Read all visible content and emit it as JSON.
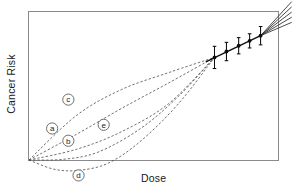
{
  "chart_data": {
    "type": "line",
    "title": "",
    "xlabel": "Dose",
    "ylabel": "Cancer Risk",
    "grid": false,
    "legend": "inline-callouts",
    "axis_ticks": [],
    "xlim": [
      0,
      1
    ],
    "ylim": [
      0,
      1
    ],
    "convergence_point": {
      "x": 0.745,
      "y": 0.693
    },
    "observed_data": {
      "name": "Observed epidemiological data",
      "x": [
        0.745,
        0.793,
        0.842,
        0.886,
        0.93
      ],
      "y": [
        0.693,
        0.733,
        0.772,
        0.805,
        0.84
      ],
      "yerr": [
        0.075,
        0.062,
        0.055,
        0.048,
        0.062
      ]
    },
    "series": [
      {
        "name": "a",
        "label": "a",
        "style": "dashed",
        "shape": "linear-no-threshold",
        "label_x": 0.093,
        "label_y": 0.213,
        "values_x": [
          0.0,
          0.19,
          0.37,
          0.56,
          0.745
        ],
        "values_y": [
          0.0,
          0.173,
          0.347,
          0.52,
          0.693
        ]
      },
      {
        "name": "b",
        "label": "b",
        "style": "dashed",
        "shape": "sublinear-concave-up",
        "label_x": 0.158,
        "label_y": 0.13,
        "values_x": [
          0.0,
          0.19,
          0.37,
          0.56,
          0.745
        ],
        "values_y": [
          0.0,
          0.072,
          0.19,
          0.38,
          0.693
        ]
      },
      {
        "name": "c",
        "label": "c",
        "style": "dashed",
        "shape": "supralinear-concave-down",
        "label_x": 0.158,
        "label_y": 0.408,
        "values_x": [
          0.0,
          0.19,
          0.37,
          0.56,
          0.745
        ],
        "values_y": [
          0.0,
          0.3,
          0.475,
          0.59,
          0.693
        ]
      },
      {
        "name": "d",
        "label": "d",
        "style": "dashed",
        "shape": "hormesis-dips-below-zero",
        "label_x": 0.199,
        "label_y": -0.104,
        "values_x": [
          0.0,
          0.1,
          0.2,
          0.32,
          0.45,
          0.6,
          0.745
        ],
        "values_y": [
          0.0,
          -0.062,
          -0.07,
          -0.02,
          0.13,
          0.38,
          0.693
        ]
      },
      {
        "name": "e",
        "label": "e",
        "style": "dashed",
        "shape": "threshold",
        "label_x": 0.3,
        "label_y": 0.238,
        "values_x": [
          0.0,
          0.14,
          0.28,
          0.45,
          0.6,
          0.745
        ],
        "values_y": [
          0.0,
          0.005,
          0.055,
          0.215,
          0.43,
          0.693
        ]
      }
    ],
    "high_dose_fan": {
      "name": "Extrapolation fan beyond observed range",
      "count": 5,
      "origin_x": 0.93,
      "origin_y": 0.84,
      "end_y_spread": [
        0.93,
        0.965,
        1.0,
        1.035,
        1.07
      ]
    }
  },
  "labels": {
    "xlabel": "Dose",
    "ylabel": "Cancer Risk",
    "a": "a",
    "b": "b",
    "c": "c",
    "d": "d",
    "e": "e"
  },
  "colors": {
    "frame": "#8a8a8a",
    "curve": "#4d4d4d",
    "data": "#0d0d0d",
    "text": "#1a1a1a",
    "background": "#ffffff"
  }
}
